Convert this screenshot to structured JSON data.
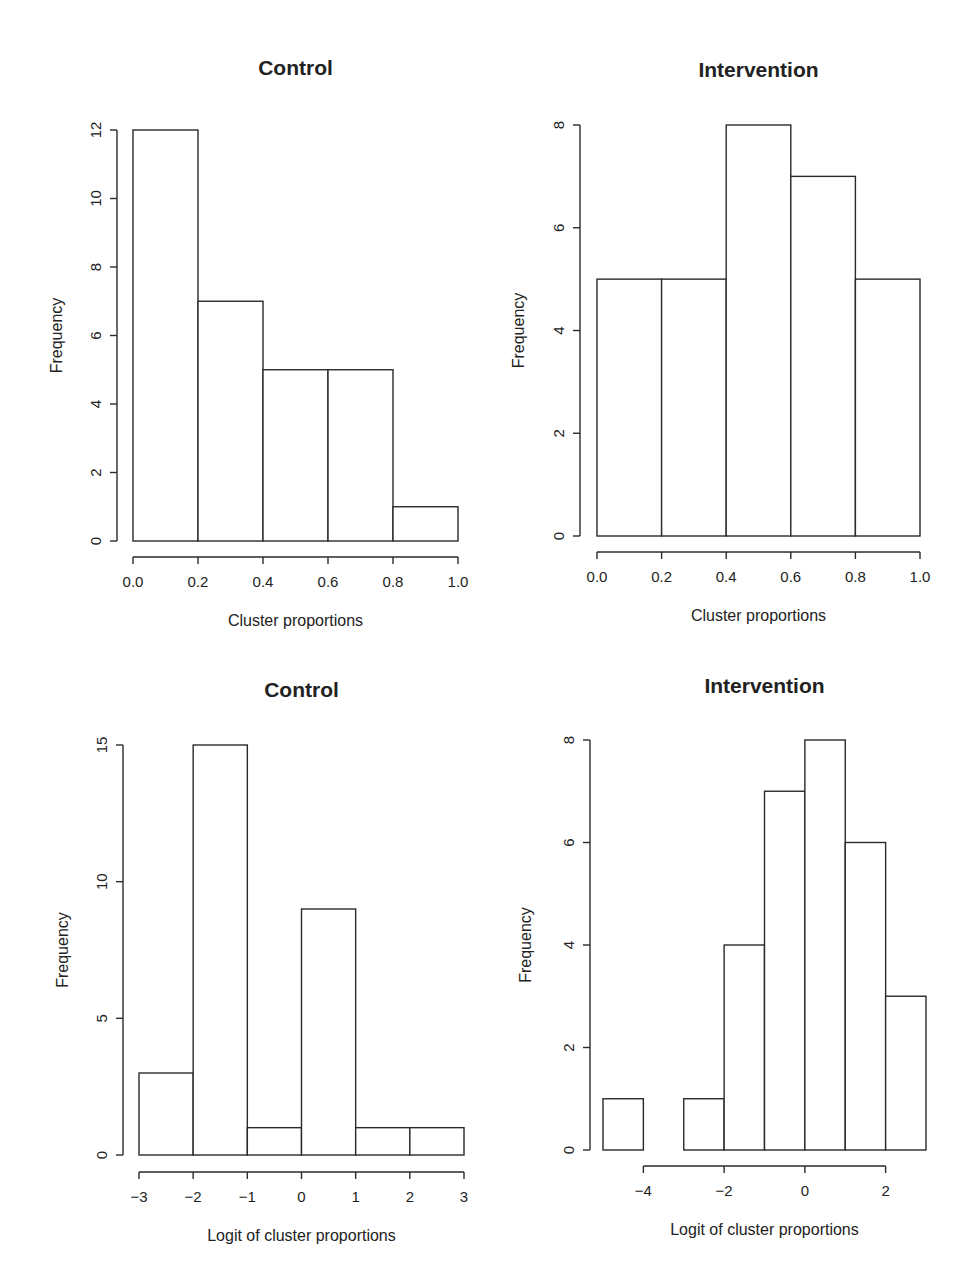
{
  "figure": {
    "layout": "2x2 grid of histograms"
  },
  "chart_data": [
    {
      "id": "top-left",
      "type": "bar",
      "subtype": "histogram",
      "title": "Control",
      "xlabel": "Cluster proportions",
      "ylabel": "Frequency",
      "bin_edges": [
        0.0,
        0.2,
        0.4,
        0.6,
        0.8,
        1.0
      ],
      "values": [
        12,
        7,
        5,
        5,
        1
      ],
      "xticks": [
        0.0,
        0.2,
        0.4,
        0.6,
        0.8,
        1.0
      ],
      "xtick_labels": [
        "0.0",
        "0.2",
        "0.4",
        "0.6",
        "0.8",
        "1.0"
      ],
      "yticks": [
        0,
        2,
        4,
        6,
        8,
        10,
        12
      ],
      "ytick_labels": [
        "0",
        "2",
        "4",
        "6",
        "8",
        "10",
        "12"
      ],
      "xlim": [
        0.0,
        1.0
      ],
      "ylim": [
        0,
        12
      ],
      "grid": false,
      "legend": null
    },
    {
      "id": "top-right",
      "type": "bar",
      "subtype": "histogram",
      "title": "Intervention",
      "xlabel": "Cluster proportions",
      "ylabel": "Frequency",
      "bin_edges": [
        0.0,
        0.2,
        0.4,
        0.6,
        0.8,
        1.0
      ],
      "values": [
        5,
        5,
        8,
        7,
        5
      ],
      "xticks": [
        0.0,
        0.2,
        0.4,
        0.6,
        0.8,
        1.0
      ],
      "xtick_labels": [
        "0.0",
        "0.2",
        "0.4",
        "0.6",
        "0.8",
        "1.0"
      ],
      "yticks": [
        0,
        2,
        4,
        6,
        8
      ],
      "ytick_labels": [
        "0",
        "2",
        "4",
        "6",
        "8"
      ],
      "xlim": [
        0.0,
        1.0
      ],
      "ylim": [
        0,
        8
      ],
      "grid": false,
      "legend": null
    },
    {
      "id": "bottom-left",
      "type": "bar",
      "subtype": "histogram",
      "title": "Control",
      "xlabel": "Logit of cluster proportions",
      "ylabel": "Frequency",
      "bin_edges": [
        -3,
        -2,
        -1,
        0,
        1,
        2,
        3
      ],
      "values": [
        3,
        15,
        1,
        9,
        1,
        1
      ],
      "xticks": [
        -3,
        -2,
        -1,
        0,
        1,
        2,
        3
      ],
      "xtick_labels": [
        "−3",
        "−2",
        "−1",
        "0",
        "1",
        "2",
        "3"
      ],
      "yticks": [
        0,
        5,
        10,
        15
      ],
      "ytick_labels": [
        "0",
        "5",
        "10",
        "15"
      ],
      "xlim": [
        -3,
        3
      ],
      "ylim": [
        0,
        15
      ],
      "grid": false,
      "legend": null
    },
    {
      "id": "bottom-right",
      "type": "bar",
      "subtype": "histogram",
      "title": "Intervention",
      "xlabel": "Logit of cluster proportions",
      "ylabel": "Frequency",
      "bin_edges": [
        -5,
        -4,
        -3,
        -2,
        -1,
        0,
        1,
        2,
        3
      ],
      "values": [
        1,
        0,
        1,
        4,
        7,
        8,
        6,
        3
      ],
      "xticks": [
        -4,
        -2,
        0,
        2
      ],
      "xtick_labels": [
        "−4",
        "−2",
        "0",
        "2"
      ],
      "yticks": [
        0,
        2,
        4,
        6,
        8
      ],
      "ytick_labels": [
        "0",
        "2",
        "4",
        "6",
        "8"
      ],
      "xlim": [
        -5,
        3
      ],
      "ylim": [
        0,
        8
      ],
      "grid": false,
      "legend": null
    }
  ]
}
